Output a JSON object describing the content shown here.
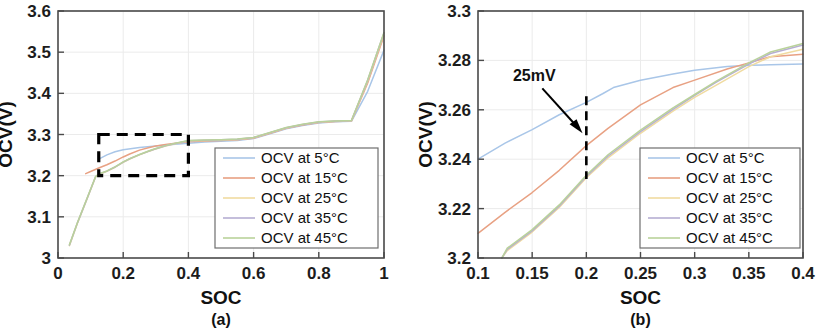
{
  "figure": {
    "panels": [
      {
        "caption": "(a)",
        "xlabel": "SOC",
        "ylabel": "OCV(V)",
        "xticks": [
          "0",
          "0.2",
          "0.4",
          "0.6",
          "0.8",
          "1"
        ],
        "yticks": [
          "3",
          "3.1",
          "3.2",
          "3.3",
          "3.4",
          "3.5",
          "3.6"
        ],
        "xlim": [
          0,
          1
        ],
        "ylim": [
          3.0,
          3.6
        ]
      },
      {
        "caption": "(b)",
        "xlabel": "SOC",
        "ylabel": "OCV(V)",
        "xticks": [
          "0.1",
          "0.15",
          "0.2",
          "0.25",
          "0.3",
          "0.35",
          "0.4"
        ],
        "yticks": [
          "3.2",
          "3.22",
          "3.24",
          "3.26",
          "3.28",
          "3.3"
        ],
        "xlim": [
          0.1,
          0.4
        ],
        "ylim": [
          3.2,
          3.3
        ],
        "annotation": {
          "label": "25mV",
          "at_soc": 0.2,
          "span": [
            3.232,
            3.2655
          ]
        }
      }
    ],
    "legend": {
      "entries": [
        {
          "label": "OCV at 5°C",
          "color": "#a9c6e8"
        },
        {
          "label": "OCV at 15°C",
          "color": "#e8a183"
        },
        {
          "label": "OCV at 25°C",
          "color": "#f0dba0"
        },
        {
          "label": "OCV at 35°C",
          "color": "#b6aed2"
        },
        {
          "label": "OCV at 45°C",
          "color": "#b9d29a"
        }
      ]
    },
    "zoom_box": {
      "x0": 0.125,
      "x1": 0.4,
      "y0": 3.2,
      "y1": 3.3
    }
  },
  "chart_data": [
    {
      "type": "line",
      "panel": "(a)",
      "title": "",
      "xlabel": "SOC",
      "ylabel": "OCV(V)",
      "xlim": [
        0,
        1
      ],
      "ylim": [
        3.0,
        3.6
      ],
      "xticks": [
        0,
        0.2,
        0.4,
        0.6,
        0.8,
        1
      ],
      "yticks": [
        3.0,
        3.1,
        3.2,
        3.3,
        3.4,
        3.5,
        3.6
      ],
      "grid": true,
      "legend_position": "lower-right",
      "annotations": [
        {
          "type": "dashed-rectangle",
          "x0": 0.125,
          "x1": 0.4,
          "y0": 3.2,
          "y1": 3.3
        }
      ],
      "series": [
        {
          "name": "OCV at 5°C",
          "color": "#a9c6e8",
          "x": [
            0.125,
            0.15,
            0.175,
            0.2,
            0.25,
            0.3,
            0.35,
            0.4,
            0.45,
            0.5,
            0.55,
            0.6,
            0.65,
            0.7,
            0.75,
            0.8,
            0.85,
            0.9,
            0.95,
            1.0
          ],
          "y": [
            3.24,
            3.2505,
            3.258,
            3.263,
            3.2685,
            3.272,
            3.276,
            3.279,
            3.2815,
            3.2835,
            3.2855,
            3.29,
            3.302,
            3.314,
            3.322,
            3.328,
            3.331,
            3.332,
            3.405,
            3.505
          ]
        },
        {
          "name": "OCV at 15°C",
          "color": "#e8a183",
          "x": [
            0.085,
            0.1,
            0.125,
            0.15,
            0.175,
            0.2,
            0.22,
            0.25,
            0.28,
            0.3,
            0.33,
            0.36,
            0.4,
            0.45,
            0.5,
            0.55,
            0.6,
            0.65,
            0.7,
            0.75,
            0.8,
            0.85,
            0.9,
            0.95,
            1.0
          ],
          "y": [
            3.205,
            3.21,
            3.2185,
            3.2265,
            3.2355,
            3.2455,
            3.2525,
            3.262,
            3.2685,
            3.272,
            3.2755,
            3.2785,
            3.2825,
            3.2845,
            3.2855,
            3.287,
            3.291,
            3.303,
            3.315,
            3.323,
            3.329,
            3.3315,
            3.3325,
            3.425,
            3.54
          ]
        },
        {
          "name": "OCV at 25°C",
          "color": "#f0dba0",
          "x": [
            0.035,
            0.06,
            0.09,
            0.115,
            0.125,
            0.15,
            0.175,
            0.2,
            0.22,
            0.25,
            0.28,
            0.3,
            0.33,
            0.36,
            0.4,
            0.45,
            0.5,
            0.55,
            0.6,
            0.65,
            0.7,
            0.75,
            0.8,
            0.85,
            0.9,
            0.95,
            1.0
          ],
          "y": [
            3.03,
            3.085,
            3.145,
            3.196,
            3.203,
            3.2105,
            3.2205,
            3.2325,
            3.2405,
            3.2505,
            3.2595,
            3.265,
            3.272,
            3.2775,
            3.2845,
            3.2855,
            3.2865,
            3.288,
            3.292,
            3.304,
            3.316,
            3.324,
            3.33,
            3.332,
            3.333,
            3.43,
            3.545
          ]
        },
        {
          "name": "OCV at 35°C",
          "color": "#b6aed2",
          "x": [
            0.035,
            0.06,
            0.09,
            0.115,
            0.125,
            0.15,
            0.175,
            0.2,
            0.22,
            0.25,
            0.28,
            0.3,
            0.33,
            0.36,
            0.4,
            0.45,
            0.5,
            0.55,
            0.6,
            0.65,
            0.7,
            0.75,
            0.8,
            0.85,
            0.9,
            0.95,
            1.0
          ],
          "y": [
            3.031,
            3.086,
            3.146,
            3.197,
            3.2035,
            3.211,
            3.221,
            3.233,
            3.241,
            3.251,
            3.26,
            3.2655,
            3.2725,
            3.278,
            3.285,
            3.286,
            3.287,
            3.2885,
            3.2925,
            3.3045,
            3.3165,
            3.3245,
            3.3305,
            3.3325,
            3.3335,
            3.432,
            3.547
          ]
        },
        {
          "name": "OCV at 45°C",
          "color": "#b9d29a",
          "x": [
            0.035,
            0.06,
            0.09,
            0.115,
            0.125,
            0.15,
            0.175,
            0.2,
            0.22,
            0.25,
            0.28,
            0.3,
            0.33,
            0.36,
            0.4,
            0.45,
            0.5,
            0.55,
            0.6,
            0.65,
            0.7,
            0.75,
            0.8,
            0.85,
            0.9,
            0.95,
            1.0
          ],
          "y": [
            3.032,
            3.087,
            3.147,
            3.1975,
            3.204,
            3.2115,
            3.2215,
            3.2335,
            3.2415,
            3.2515,
            3.2605,
            3.266,
            3.273,
            3.2785,
            3.2855,
            3.2865,
            3.2875,
            3.289,
            3.293,
            3.305,
            3.317,
            3.325,
            3.331,
            3.333,
            3.334,
            3.433,
            3.548
          ]
        }
      ]
    },
    {
      "type": "line",
      "panel": "(b)",
      "title": "",
      "xlabel": "SOC",
      "ylabel": "OCV(V)",
      "xlim": [
        0.1,
        0.4
      ],
      "ylim": [
        3.2,
        3.3
      ],
      "xticks": [
        0.1,
        0.15,
        0.2,
        0.25,
        0.3,
        0.35,
        0.4
      ],
      "yticks": [
        3.2,
        3.22,
        3.24,
        3.26,
        3.28,
        3.3
      ],
      "grid": true,
      "legend_position": "lower-right",
      "annotations": [
        {
          "type": "text-arrow",
          "label": "25mV",
          "text_x": 0.152,
          "text_y": 3.2715,
          "arrow_to_x": 3.2,
          "arrow_to_y": 3.2
        },
        {
          "type": "dashed-vline",
          "x": 0.2,
          "y0": 3.232,
          "y1": 3.2655
        }
      ],
      "series": [
        {
          "name": "OCV at 5°C",
          "color": "#a9c6e8",
          "x": [
            0.1,
            0.125,
            0.15,
            0.175,
            0.2,
            0.215,
            0.225,
            0.25,
            0.28,
            0.3,
            0.33,
            0.35,
            0.37,
            0.4
          ],
          "y": [
            3.24,
            3.2465,
            3.252,
            3.258,
            3.263,
            3.2665,
            3.269,
            3.272,
            3.2745,
            3.276,
            3.2775,
            3.278,
            3.2782,
            3.2785
          ]
        },
        {
          "name": "OCV at 15°C",
          "color": "#e8a183",
          "x": [
            0.1,
            0.125,
            0.15,
            0.175,
            0.2,
            0.22,
            0.25,
            0.28,
            0.3,
            0.33,
            0.35,
            0.37,
            0.4
          ],
          "y": [
            3.21,
            3.2185,
            3.2265,
            3.2355,
            3.2455,
            3.2525,
            3.262,
            3.269,
            3.272,
            3.2765,
            3.279,
            3.2815,
            3.2825
          ]
        },
        {
          "name": "OCV at 25°C",
          "color": "#f0dba0",
          "x": [
            0.122,
            0.127,
            0.15,
            0.175,
            0.2,
            0.22,
            0.25,
            0.28,
            0.3,
            0.32,
            0.35,
            0.37,
            0.4
          ],
          "y": [
            3.2,
            3.203,
            3.2105,
            3.2205,
            3.2325,
            3.2405,
            3.2505,
            3.2595,
            3.265,
            3.27,
            3.2775,
            3.2815,
            3.2845
          ]
        },
        {
          "name": "OCV at 35°C",
          "color": "#b6aed2",
          "x": [
            0.122,
            0.127,
            0.15,
            0.175,
            0.2,
            0.22,
            0.25,
            0.28,
            0.3,
            0.32,
            0.35,
            0.37,
            0.4
          ],
          "y": [
            3.2,
            3.2035,
            3.211,
            3.221,
            3.233,
            3.2412,
            3.2512,
            3.2602,
            3.2658,
            3.2712,
            3.2785,
            3.2828,
            3.2862
          ]
        },
        {
          "name": "OCV at 45°C",
          "color": "#b9d29a",
          "x": [
            0.122,
            0.127,
            0.15,
            0.175,
            0.2,
            0.22,
            0.25,
            0.28,
            0.3,
            0.32,
            0.35,
            0.37,
            0.4
          ],
          "y": [
            3.2,
            3.204,
            3.2115,
            3.2215,
            3.2335,
            3.2418,
            3.2518,
            3.2608,
            3.2662,
            3.2716,
            3.279,
            3.2834,
            3.2868
          ]
        }
      ]
    }
  ]
}
